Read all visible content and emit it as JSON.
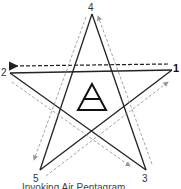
{
  "diagram": {
    "vertices": [
      {
        "id": "1",
        "label": "1",
        "emphasized": true
      },
      {
        "id": "2",
        "label": "2",
        "emphasized": false
      },
      {
        "id": "3",
        "label": "3",
        "emphasized": false
      },
      {
        "id": "4",
        "label": "4",
        "emphasized": false
      },
      {
        "id": "5",
        "label": "5",
        "emphasized": false
      }
    ],
    "trace_order": [
      "1",
      "2",
      "3",
      "4",
      "5",
      "1"
    ],
    "first_stroke": {
      "from": "1",
      "to": "2",
      "style": "dashed-black"
    },
    "other_strokes_style": "dashed-gray",
    "center_symbol": "air-triangle-icon",
    "colors": {
      "star_line": "#222222",
      "first_arrow": "#222222",
      "guide_arrow": "#999999",
      "background": "#ffffff"
    },
    "caption_partial": "Invoking Air Pentagram"
  }
}
